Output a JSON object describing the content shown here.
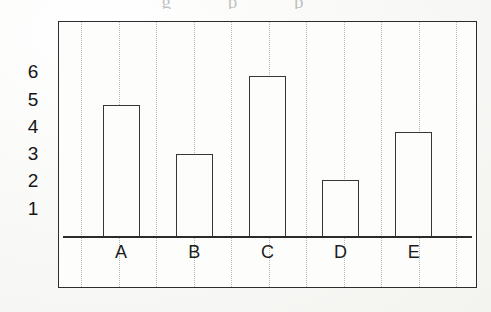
{
  "page": {
    "background_color": "#fbfbf9",
    "bleed_through_text": "g p p"
  },
  "figure": {
    "frame_color": "#2d2d2d",
    "plot_background": "#fdfdfc",
    "axis_color": "#2b2b2b",
    "bar_outline_color": "#35353a",
    "bar_fill_color": "#fdfdfc",
    "gridline_color": "#b9b9b4",
    "gridline_count": 11
  },
  "chart_data": {
    "type": "bar",
    "title": "",
    "xlabel": "",
    "ylabel": "",
    "categories": [
      "A",
      "B",
      "C",
      "D",
      "E"
    ],
    "values": [
      4.8,
      3.0,
      5.85,
      2.05,
      3.8
    ],
    "ytick_labels": [
      "6",
      "5",
      "4",
      "3",
      "2",
      "1"
    ],
    "ytick_values": [
      6,
      5,
      4,
      3,
      2,
      1
    ],
    "ylim": [
      0,
      6.6
    ],
    "grid": true,
    "grid_orientation": "vertical",
    "legend": null,
    "legend_position": "none",
    "bar_style": "hollow-outline"
  }
}
